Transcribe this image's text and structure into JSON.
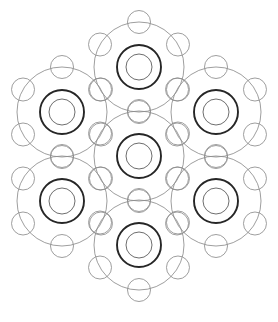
{
  "artwork": {
    "title": "Hexagonal Circle Lattice Mandala",
    "description": "Monochrome line drawing: seven overlapping circular motifs arranged on a hexagonal lattice forming a snowflake / flower-of-life style rosette",
    "background_color": "#ffffff",
    "canvas": {
      "width": 278,
      "height": 322
    }
  },
  "style": {
    "bold_stroke_color": "#262626",
    "bold_stroke_width": 1.9,
    "thin_stroke_color": "#8c8c8c",
    "thin_stroke_width": 0.85,
    "mid_stroke_color": "#6e6e6e",
    "mid_stroke_width": 1.0,
    "fill": "none"
  },
  "geometry": {
    "motif_centers": [
      {
        "name": "center",
        "cx": 139,
        "cy": 156
      },
      {
        "name": "north",
        "cx": 139,
        "cy": 67
      },
      {
        "name": "south",
        "cx": 139,
        "cy": 245
      },
      {
        "name": "northwest",
        "cx": 62,
        "cy": 112
      },
      {
        "name": "northeast",
        "cx": 216,
        "cy": 112
      },
      {
        "name": "southwest",
        "cx": 62,
        "cy": 201
      },
      {
        "name": "southeast",
        "cx": 216,
        "cy": 201
      }
    ],
    "lattice_step_x": 77,
    "lattice_step_y": 89,
    "outer_circle_radius": 45,
    "bold_ring_radius": 22,
    "inner_circle_radius": 13,
    "satellite_radius": 11.5,
    "satellite_ring_radius": 45,
    "satellite_angles_deg": [
      90,
      150,
      210,
      270,
      330,
      30
    ],
    "satellite_count": 6
  },
  "chart_data": {
    "type": "scatter",
    "xlabel": "",
    "ylabel": "",
    "xlim": [
      0,
      278
    ],
    "ylim": [
      0,
      322
    ],
    "grid": false,
    "legend": "none",
    "series": [
      {
        "name": "outer-circles",
        "radius": 45,
        "stroke": "#8c8c8c",
        "x": [
          139,
          139,
          139,
          62,
          216,
          62,
          216
        ],
        "y": [
          156,
          67,
          245,
          112,
          112,
          201,
          201
        ]
      },
      {
        "name": "bold-rings",
        "radius": 22,
        "stroke": "#262626",
        "x": [
          139,
          139,
          139,
          62,
          216,
          62,
          216
        ],
        "y": [
          156,
          67,
          245,
          112,
          112,
          201,
          201
        ]
      },
      {
        "name": "inner-circles",
        "radius": 13,
        "stroke": "#8c8c8c",
        "x": [
          139,
          139,
          139,
          62,
          216,
          62,
          216
        ],
        "y": [
          156,
          67,
          245,
          112,
          112,
          201,
          201
        ]
      },
      {
        "name": "satellite-circles",
        "radius": 11.5,
        "stroke": "#8c8c8c",
        "count_per_motif": 6,
        "ring_radius": 45
      }
    ]
  }
}
